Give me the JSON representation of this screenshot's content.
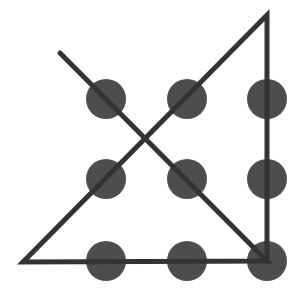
{
  "diagram": {
    "dot_color": "#4d4d4d",
    "line_color": "#333333",
    "dot_radius": 20,
    "line_width": 5,
    "dots": [
      {
        "row": 1,
        "col": 1,
        "cx": 106,
        "cy": 99
      },
      {
        "row": 1,
        "col": 2,
        "cx": 187,
        "cy": 99
      },
      {
        "row": 1,
        "col": 3,
        "cx": 267,
        "cy": 99
      },
      {
        "row": 2,
        "col": 1,
        "cx": 106,
        "cy": 179
      },
      {
        "row": 2,
        "col": 2,
        "cx": 187,
        "cy": 179
      },
      {
        "row": 2,
        "col": 3,
        "cx": 267,
        "cy": 179
      },
      {
        "row": 3,
        "col": 1,
        "cx": 106,
        "cy": 261
      },
      {
        "row": 3,
        "col": 2,
        "cx": 187,
        "cy": 261
      },
      {
        "row": 3,
        "col": 3,
        "cx": 267,
        "cy": 261
      }
    ],
    "path_points": [
      [
        60,
        53
      ],
      [
        267,
        261
      ],
      [
        23,
        262
      ],
      [
        267,
        15
      ],
      [
        267,
        261
      ]
    ],
    "segments": 4
  }
}
